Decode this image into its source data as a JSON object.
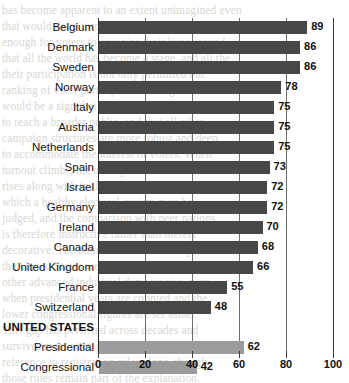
{
  "chart_data": {
    "type": "bar",
    "orientation": "horizontal",
    "title": "",
    "xlabel": "",
    "ylabel": "",
    "xlim": [
      0,
      100
    ],
    "xticks": [
      0,
      20,
      40,
      60,
      80,
      100
    ],
    "grid": true,
    "legend": false,
    "categories": [
      "Belgium",
      "Denmark",
      "Sweden",
      "Norway",
      "Italy",
      "Austria",
      "Netherlands",
      "Spain",
      "Israel",
      "Germany",
      "Ireland",
      "Canada",
      "United Kingdom",
      "France",
      "Switzerland",
      "UNITED STATES",
      "Presidential",
      "Congressional"
    ],
    "values": [
      89,
      86,
      86,
      78,
      75,
      75,
      75,
      73,
      72,
      72,
      70,
      68,
      66,
      55,
      48,
      null,
      62,
      42
    ],
    "bars": [
      {
        "label": "Belgium",
        "value": 89,
        "group": "country",
        "heading": false,
        "color": "#474747"
      },
      {
        "label": "Denmark",
        "value": 86,
        "group": "country",
        "heading": false,
        "color": "#474747"
      },
      {
        "label": "Sweden",
        "value": 86,
        "group": "country",
        "heading": false,
        "color": "#474747"
      },
      {
        "label": "Norway",
        "value": 78,
        "group": "country",
        "heading": false,
        "color": "#474747"
      },
      {
        "label": "Italy",
        "value": 75,
        "group": "country",
        "heading": false,
        "color": "#474747"
      },
      {
        "label": "Austria",
        "value": 75,
        "group": "country",
        "heading": false,
        "color": "#474747"
      },
      {
        "label": "Netherlands",
        "value": 75,
        "group": "country",
        "heading": false,
        "color": "#474747"
      },
      {
        "label": "Spain",
        "value": 73,
        "group": "country",
        "heading": false,
        "color": "#474747"
      },
      {
        "label": "Israel",
        "value": 72,
        "group": "country",
        "heading": false,
        "color": "#474747"
      },
      {
        "label": "Germany",
        "value": 72,
        "group": "country",
        "heading": false,
        "color": "#474747"
      },
      {
        "label": "Ireland",
        "value": 70,
        "group": "country",
        "heading": false,
        "color": "#474747"
      },
      {
        "label": "Canada",
        "value": 68,
        "group": "country",
        "heading": false,
        "color": "#474747"
      },
      {
        "label": "United Kingdom",
        "value": 66,
        "group": "country",
        "heading": false,
        "color": "#474747"
      },
      {
        "label": "France",
        "value": 55,
        "group": "country",
        "heading": false,
        "color": "#474747"
      },
      {
        "label": "Switzerland",
        "value": 48,
        "group": "country",
        "heading": false,
        "color": "#474747"
      },
      {
        "label": "UNITED STATES",
        "value": null,
        "group": "heading",
        "heading": true,
        "color": null
      },
      {
        "label": "Presidential",
        "value": 62,
        "group": "us",
        "heading": false,
        "color": "#9b9b9b"
      },
      {
        "label": "Congressional",
        "value": 42,
        "group": "us",
        "heading": false,
        "color": "#9b9b9b"
      }
    ]
  },
  "background_text": {
    "lines": [
      "has become apparent to an extent unimagined even",
      "that would deter turnout without threatening the",
      "enough for voters to organize their lives around",
      "that all the world has become a stage, and all the",
      "their participation is not only permitted but",
      "ranking of voter participation among democracies",
      "would be a sign that the system has found ways",
      "to reach a broader public, and that all other",
      "campaign structures are more robust and deep",
      "to accommodate the interest of voters. When",
      "turnout climbs, the quality of the mandate",
      "rises along with it; this is the standard by",
      "which a healthy electoral system may be",
      "judged, and the comparison with peer nations",
      "is therefore instructive rather than merely",
      "decorative. The numbers shown below place",
      "the United States well behind most of the",
      "other advanced industrial democracies, even",
      "when presidential years are counted and the",
      "lower congressional figures are set aside.",
      "This gap has persisted across decades and",
      "survives most attempts to explain it away by",
      "reference to registration rules alone, though",
      "those rules remain part of the explanation."
    ]
  }
}
